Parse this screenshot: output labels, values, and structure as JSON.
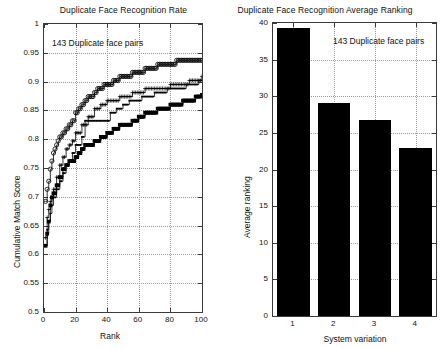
{
  "figure": {
    "width": 446,
    "height": 349,
    "background": "#ffffff",
    "ink_color": "#000000",
    "grid_color": "#9a9a9a"
  },
  "chart_data": [
    {
      "id": "cmc-plot",
      "type": "line",
      "title": "Duplicate Face Recognition Rate",
      "xlabel": "Rank",
      "ylabel": "Cumulative Match Score",
      "xlim": [
        0,
        100
      ],
      "ylim": [
        0.5,
        1
      ],
      "xticks": [
        0,
        20,
        40,
        60,
        80,
        100
      ],
      "xticklabels": [
        "0",
        "20",
        "40",
        "60",
        "80",
        "100"
      ],
      "yticks": [
        0.5,
        0.55,
        0.6,
        0.65,
        0.7,
        0.75,
        0.8,
        0.85,
        0.9,
        0.95,
        1
      ],
      "yticklabels": [
        "0.5",
        "0.55",
        "0.6",
        "0.65",
        "0.7",
        "0.75",
        "0.8",
        "0.85",
        "0.9",
        "0.95",
        "1"
      ],
      "grid": true,
      "legend": "none",
      "annotations": [
        {
          "text": "143 Duplicate face pairs",
          "x": 6,
          "y": 0.963
        }
      ],
      "series": [
        {
          "name": "system-1-circle",
          "marker": "circle",
          "x": [
            1,
            2,
            3,
            4,
            5,
            6,
            7,
            8,
            9,
            10,
            12,
            14,
            16,
            18,
            20,
            22,
            24,
            26,
            28,
            30,
            32,
            34,
            36,
            38,
            40,
            44,
            48,
            52,
            56,
            60,
            64,
            68,
            72,
            76,
            80,
            84,
            88,
            92,
            96,
            100
          ],
          "y": [
            0.692,
            0.713,
            0.727,
            0.748,
            0.762,
            0.776,
            0.783,
            0.79,
            0.797,
            0.804,
            0.811,
            0.818,
            0.825,
            0.832,
            0.846,
            0.853,
            0.86,
            0.867,
            0.874,
            0.874,
            0.881,
            0.888,
            0.888,
            0.895,
            0.895,
            0.902,
            0.909,
            0.909,
            0.916,
            0.916,
            0.923,
            0.923,
            0.93,
            0.93,
            0.93,
            0.937,
            0.937,
            0.937,
            0.937,
            0.937
          ]
        },
        {
          "name": "system-2-plus",
          "marker": "plus",
          "x": [
            1,
            2,
            3,
            4,
            5,
            6,
            8,
            10,
            12,
            14,
            16,
            18,
            20,
            24,
            28,
            32,
            36,
            40,
            44,
            48,
            52,
            56,
            60,
            64,
            68,
            72,
            76,
            80,
            84,
            88,
            92,
            96,
            100
          ],
          "y": [
            0.629,
            0.664,
            0.678,
            0.692,
            0.699,
            0.713,
            0.734,
            0.755,
            0.769,
            0.783,
            0.79,
            0.797,
            0.811,
            0.825,
            0.839,
            0.853,
            0.86,
            0.867,
            0.867,
            0.874,
            0.874,
            0.881,
            0.881,
            0.888,
            0.888,
            0.888,
            0.888,
            0.895,
            0.895,
            0.895,
            0.902,
            0.902,
            0.909
          ]
        },
        {
          "name": "system-3-dot",
          "marker": "dot",
          "x": [
            1,
            2,
            3,
            4,
            5,
            6,
            8,
            10,
            12,
            14,
            16,
            18,
            20,
            24,
            26,
            30,
            34,
            38,
            42,
            46,
            50,
            54,
            58,
            62,
            66,
            70,
            74,
            78,
            82,
            86,
            90,
            94,
            98,
            100
          ],
          "y": [
            0.615,
            0.643,
            0.657,
            0.671,
            0.685,
            0.699,
            0.713,
            0.727,
            0.741,
            0.755,
            0.762,
            0.776,
            0.79,
            0.804,
            0.832,
            0.832,
            0.832,
            0.832,
            0.846,
            0.853,
            0.86,
            0.867,
            0.867,
            0.874,
            0.874,
            0.881,
            0.881,
            0.888,
            0.888,
            0.888,
            0.895,
            0.895,
            0.902,
            0.902
          ]
        },
        {
          "name": "system-4-square",
          "marker": "square",
          "x": [
            1,
            2,
            3,
            4,
            5,
            6,
            8,
            10,
            12,
            14,
            16,
            18,
            20,
            22,
            24,
            26,
            28,
            32,
            36,
            40,
            44,
            48,
            52,
            56,
            60,
            64,
            68,
            72,
            76,
            80,
            84,
            88,
            92,
            96,
            100
          ],
          "y": [
            0.615,
            0.636,
            0.657,
            0.685,
            0.699,
            0.706,
            0.72,
            0.734,
            0.748,
            0.755,
            0.762,
            0.762,
            0.769,
            0.776,
            0.783,
            0.79,
            0.79,
            0.797,
            0.804,
            0.811,
            0.818,
            0.825,
            0.825,
            0.832,
            0.839,
            0.846,
            0.846,
            0.853,
            0.853,
            0.86,
            0.86,
            0.867,
            0.867,
            0.874,
            0.877
          ]
        }
      ]
    },
    {
      "id": "ranking-plot",
      "type": "bar",
      "title": "Duplicate Face Recognition Average Ranking",
      "xlabel": "System variation",
      "ylabel": "Average ranking",
      "categories": [
        "1",
        "2",
        "3",
        "4"
      ],
      "values": [
        39.3,
        29.1,
        26.8,
        23.0
      ],
      "xlim": [
        0.5,
        4.5
      ],
      "ylim": [
        0,
        40
      ],
      "yticks": [
        0,
        5,
        10,
        15,
        20,
        25,
        30,
        35,
        40
      ],
      "yticklabels": [
        "0",
        "5",
        "10",
        "15",
        "20",
        "25",
        "30",
        "35",
        "40"
      ],
      "xticks": [
        1,
        2,
        3,
        4
      ],
      "xticklabels": [
        "1",
        "2",
        "3",
        "4"
      ],
      "grid": true,
      "bar_color": "#000000",
      "annotations": [
        {
          "text": "143 Duplicate face pairs",
          "x": 2.55,
          "y": 37.0
        }
      ]
    }
  ]
}
